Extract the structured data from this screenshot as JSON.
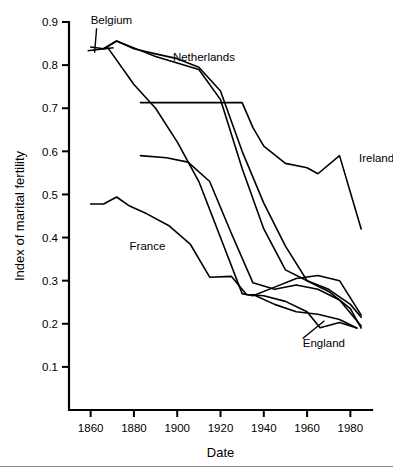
{
  "chart_data": {
    "type": "line",
    "title": "",
    "xlabel": "Date",
    "ylabel": "Index of marital fertility",
    "xlim": [
      1850,
      1990
    ],
    "ylim": [
      0.0,
      0.9
    ],
    "xticks": [
      1860,
      1880,
      1900,
      1920,
      1940,
      1960,
      1980
    ],
    "yticks": [
      0.1,
      0.2,
      0.3,
      0.4,
      0.5,
      0.6,
      0.7,
      0.8,
      0.9
    ],
    "grid": false,
    "legend_position": "inline-annotations",
    "series": [
      {
        "name": "Belgium",
        "label_shown": "Belgium",
        "x": [
          1860,
          1866,
          1872,
          1880,
          1890,
          1900,
          1910,
          1920,
          1930,
          1940,
          1950,
          1960,
          1970,
          1980,
          1985
        ],
        "y": [
          0.842,
          0.838,
          0.856,
          0.838,
          0.826,
          0.815,
          0.795,
          0.74,
          0.6,
          0.48,
          0.38,
          0.3,
          0.28,
          0.245,
          0.215
        ]
      },
      {
        "name": "Netherlands",
        "label_shown": "Netherlands",
        "x": [
          1866,
          1872,
          1880,
          1890,
          1900,
          1910,
          1920,
          1930,
          1940,
          1950,
          1960,
          1970,
          1980,
          1985
        ],
        "y": [
          0.838,
          0.856,
          0.84,
          0.82,
          0.805,
          0.79,
          0.72,
          0.56,
          0.42,
          0.325,
          0.3,
          0.275,
          0.235,
          0.19
        ]
      },
      {
        "name": "Ireland",
        "label_shown": "Ireland",
        "x": [
          1883,
          1900,
          1910,
          1920,
          1930,
          1935,
          1940,
          1950,
          1960,
          1965,
          1975,
          1985
        ],
        "y": [
          0.713,
          0.713,
          0.713,
          0.713,
          0.713,
          0.655,
          0.612,
          0.572,
          0.562,
          0.548,
          0.59,
          0.42
        ]
      },
      {
        "name": "Scotland",
        "label_shown": "",
        "x": [
          1883,
          1895,
          1905,
          1915,
          1925,
          1935,
          1945,
          1955,
          1965,
          1975,
          1985
        ],
        "y": [
          0.59,
          0.585,
          0.575,
          0.53,
          0.41,
          0.295,
          0.28,
          0.29,
          0.28,
          0.255,
          0.195
        ]
      },
      {
        "name": "Belgium-second",
        "label_shown": "",
        "x": [
          1868,
          1880,
          1890,
          1900,
          1910,
          1920,
          1930,
          1935,
          1945,
          1955,
          1965,
          1975,
          1985
        ],
        "y": [
          0.84,
          0.755,
          0.7,
          0.622,
          0.53,
          0.4,
          0.27,
          0.265,
          0.285,
          0.305,
          0.312,
          0.3,
          0.22
        ]
      },
      {
        "name": "France",
        "label_shown": "France",
        "x": [
          1860,
          1866,
          1872,
          1878,
          1886,
          1896,
          1906,
          1915,
          1925,
          1932,
          1940,
          1950,
          1960,
          1966,
          1975,
          1983
        ],
        "y": [
          0.478,
          0.478,
          0.494,
          0.473,
          0.455,
          0.428,
          0.385,
          0.308,
          0.31,
          0.268,
          0.265,
          0.252,
          0.228,
          0.191,
          0.203,
          0.19
        ]
      },
      {
        "name": "England",
        "label_shown": "England",
        "x": [
          1935,
          1945,
          1955,
          1965,
          1975,
          1983
        ],
        "y": [
          0.268,
          0.245,
          0.228,
          0.222,
          0.21,
          0.19
        ]
      }
    ],
    "annotations": [
      {
        "text": "Belgium",
        "x": 1860,
        "y": 0.895,
        "anchor": "start"
      },
      {
        "text": "Netherlands",
        "x": 1898,
        "y": 0.81,
        "anchor": "start"
      },
      {
        "text": "Ireland",
        "x": 1984,
        "y": 0.575,
        "anchor": "start"
      },
      {
        "text": "France",
        "x": 1878,
        "y": 0.37,
        "anchor": "start"
      },
      {
        "text": "England",
        "x": 1958,
        "y": 0.145,
        "anchor": "start"
      }
    ]
  },
  "colors": {
    "line": "#000000",
    "background": "#ffffff",
    "axis": "#000000",
    "footer_rule": "#8a8a8a"
  }
}
